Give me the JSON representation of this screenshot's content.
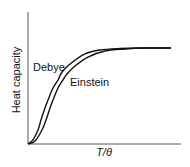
{
  "chart_data": {
    "type": "line",
    "title": "",
    "xlabel": "T/θ",
    "ylabel": "Heat capacity",
    "xlim": [
      0,
      1.5
    ],
    "ylim": [
      0,
      1.0
    ],
    "grid": false,
    "legend": "inline labels",
    "ticks": {
      "x": [],
      "y": []
    },
    "series": [
      {
        "name": "Debye",
        "label_position": {
          "x": 0.05,
          "y": 0.75
        },
        "x": [
          0,
          0.05,
          0.105,
          0.136,
          0.178,
          0.21,
          0.262,
          0.315,
          0.357,
          0.441,
          0.598,
          0.755,
          0.965,
          1.175,
          1.5
        ],
        "values": [
          0,
          0.04,
          0.146,
          0.25,
          0.375,
          0.458,
          0.583,
          0.667,
          0.75,
          0.833,
          0.938,
          0.979,
          0.995,
          1.0,
          1.0
        ]
      },
      {
        "name": "Einstein",
        "label_position": {
          "x": 0.44,
          "y": 0.6
        },
        "x": [
          0,
          0.073,
          0.147,
          0.189,
          0.231,
          0.262,
          0.315,
          0.367,
          0.409,
          0.493,
          0.629,
          0.808,
          1.017,
          1.227,
          1.5
        ],
        "values": [
          0,
          0.031,
          0.146,
          0.25,
          0.375,
          0.458,
          0.583,
          0.667,
          0.729,
          0.813,
          0.906,
          0.969,
          0.99,
          1.0,
          1.0
        ]
      }
    ]
  },
  "plot": {
    "origin_px": [
      28,
      144
    ],
    "x_axis_end_px": 181,
    "y_axis_top_px": 12,
    "x_scale_px_per_unit": 95.33,
    "y_scale_px_per_unit": 96,
    "line_color": "#111111",
    "axis_color": "#555555"
  }
}
